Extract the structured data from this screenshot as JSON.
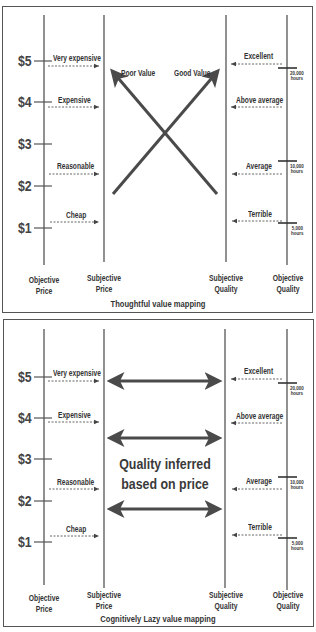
{
  "colors": {
    "line": "#555555",
    "arrow": "#4a4a4a",
    "text": "#333333",
    "background": "#ffffff"
  },
  "axes": {
    "objective_price": "Objective\nPrice",
    "subjective_price": "Subjective\nPrice",
    "subjective_quality": "Subjective\nQuality",
    "objective_quality": "Objective\nQuality"
  },
  "axis_labels": {
    "objective_price_l1": "Objective",
    "objective_price_l2": "Price",
    "subjective_price_l1": "Subjective",
    "subjective_price_l2": "Price",
    "subjective_quality_l1": "Subjective",
    "subjective_quality_l2": "Quality",
    "objective_quality_l1": "Objective",
    "objective_quality_l2": "Quality"
  },
  "price_ticks": [
    "$5",
    "$4",
    "$3",
    "$2",
    "$1"
  ],
  "price_categories": [
    "Very expensive",
    "Expensive",
    "Reasonable",
    "Cheap"
  ],
  "quality_categories": [
    "Excellent",
    "Above average",
    "Average",
    "Terrible"
  ],
  "quality_hours": [
    {
      "value": "20,000",
      "unit": "hours"
    },
    {
      "value": "10,000",
      "unit": "hours"
    },
    {
      "value": "5,000",
      "unit": "hours"
    }
  ],
  "panels": [
    {
      "caption": "Thoughtful value mapping",
      "arrows": [
        {
          "label": "Poor Value",
          "from": "subjective-quality-low",
          "to": "subjective-price-high"
        },
        {
          "label": "Good Value",
          "from": "subjective-price-low",
          "to": "subjective-quality-high"
        }
      ]
    },
    {
      "caption": "Cognitively Lazy value mapping",
      "center_text_l1": "Quality inferred",
      "center_text_l2": "based on price",
      "arrows": [
        {
          "type": "double-headed",
          "row": 1
        },
        {
          "type": "double-headed",
          "row": 2
        },
        {
          "type": "double-headed",
          "row": 3
        }
      ]
    }
  ]
}
